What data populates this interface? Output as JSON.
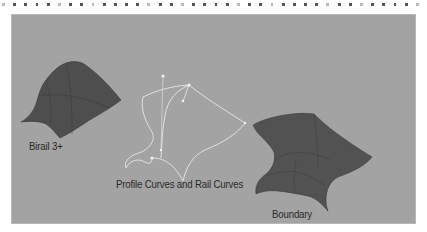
{
  "labels": {
    "birail": "Birail 3+",
    "profile_curves": "Profile Curves and Rail Curves",
    "boundary": "Boundary"
  },
  "colors": {
    "background_panel": "#a3a3a3",
    "surface_fill": "#525252",
    "curve_stroke": "#e8e8e8",
    "label_text": "#2a2a2a"
  }
}
